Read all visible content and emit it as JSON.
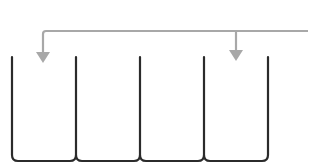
{
  "diagram": {
    "type": "bins-with-distribution-arrows",
    "colors": {
      "background": "#ffffff",
      "bins": "#2b2b2b",
      "arrows": "#a8a8a8"
    },
    "bins": {
      "count": 4,
      "dividers_x": [
        12,
        76,
        140,
        204,
        268
      ],
      "top_y": 57,
      "bottom_y": 161,
      "corner_radius": 6
    },
    "feed_line": {
      "y": 31,
      "x_start": 308,
      "x_end": 43
    },
    "arrows": [
      {
        "x": 43,
        "from_y": 31,
        "to_y": 62,
        "target_bin": 1
      },
      {
        "x": 236,
        "from_y": 31,
        "to_y": 60,
        "target_bin": 4
      }
    ]
  }
}
